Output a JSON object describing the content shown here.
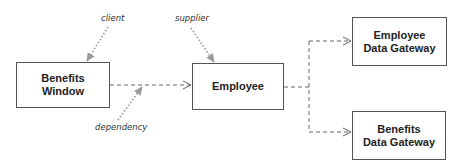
{
  "diagram": {
    "type": "uml-dependency",
    "nodes": [
      {
        "id": "benefits_window",
        "label": "Benefits\nWindow"
      },
      {
        "id": "employee",
        "label": "Employee"
      },
      {
        "id": "employee_data_gateway",
        "label": "Employee\nData Gateway"
      },
      {
        "id": "benefits_data_gateway",
        "label": "Benefits\nData Gateway"
      }
    ],
    "edges": [
      {
        "from": "benefits_window",
        "to": "employee",
        "style": "dashed",
        "arrow": "open"
      },
      {
        "from": "employee",
        "to": "employee_data_gateway",
        "style": "dashed",
        "arrow": "open"
      },
      {
        "from": "employee",
        "to": "benefits_data_gateway",
        "style": "dashed",
        "arrow": "open"
      }
    ],
    "annotations": [
      {
        "label": "client",
        "points_to": "benefits_window"
      },
      {
        "label": "supplier",
        "points_to": "employee"
      },
      {
        "label": "dependency",
        "points_to": "benefits_window->employee"
      }
    ],
    "colors": {
      "box_border": "#555555",
      "edge": "#666666",
      "annotation_arrow": "#9a9a9a"
    }
  }
}
